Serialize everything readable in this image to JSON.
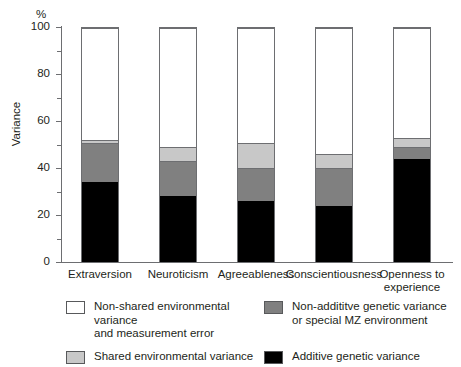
{
  "chart_data": {
    "type": "bar",
    "stacked": true,
    "title": "",
    "subtitle": "",
    "xlabel": "",
    "ylabel": "Variance",
    "yunit": "%",
    "ylim": [
      0,
      100
    ],
    "yticks": [
      0,
      20,
      40,
      60,
      80,
      100
    ],
    "ytick_labels": [
      "0",
      "20",
      "40",
      "60",
      "80",
      "100"
    ],
    "yminor_ticks": [
      10,
      30,
      50,
      70,
      90
    ],
    "grid": false,
    "legend_position": "bottom",
    "categories": [
      "Extraversion",
      "Neuroticism",
      "Agreeableness",
      "Conscientiousness",
      "Openness to experience"
    ],
    "series": [
      {
        "name": "Additive genetic variance",
        "color": "#000000",
        "values": [
          34,
          28,
          26,
          24,
          44
        ]
      },
      {
        "name": "Non-addititve genetic variance or special MZ environment",
        "color": "#808080",
        "values": [
          17,
          15,
          14,
          16,
          5
        ]
      },
      {
        "name": "Shared environmental variance",
        "color": "#c8c8c8",
        "values": [
          1,
          6,
          11,
          6,
          4
        ]
      },
      {
        "name": "Non-shared environmental variance and measurement error",
        "color": "#ffffff",
        "values": [
          48,
          51,
          49,
          54,
          47
        ]
      }
    ]
  },
  "axis": {
    "unit_label": "%",
    "y_title": "Variance"
  },
  "legend": {
    "items": [
      {
        "key": "nonshared",
        "swatch": "#ffffff",
        "line1": "Non-shared environmental variance",
        "line2": "and measurement error"
      },
      {
        "key": "nonadd",
        "swatch": "#808080",
        "line1": "Non-addititve genetic variance",
        "line2": "or special MZ environment"
      },
      {
        "key": "shared",
        "swatch": "#c8c8c8",
        "line1": "Shared environmental variance",
        "line2": ""
      },
      {
        "key": "additive",
        "swatch": "#000000",
        "line1": "Additive genetic variance",
        "line2": ""
      }
    ]
  },
  "category_labels": [
    {
      "line1": "Extraversion",
      "line2": ""
    },
    {
      "line1": "Neuroticism",
      "line2": ""
    },
    {
      "line1": "Agreeableness",
      "line2": ""
    },
    {
      "line1": "Conscientiousness",
      "line2": ""
    },
    {
      "line1": "Openness to",
      "line2": "experience"
    }
  ]
}
